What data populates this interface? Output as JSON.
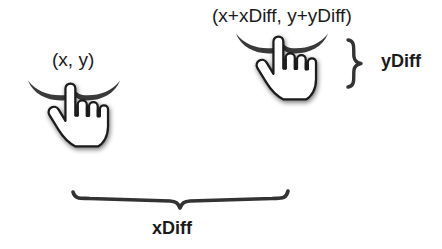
{
  "diagram": {
    "background_color": "#ffffff",
    "ink_color": "#333333",
    "text_color": "#1b1b1b",
    "hand_fill_color": "#ffffff",
    "hand_outline_color": "#1a1a1a",
    "shadow_color": "#9a9a9a",
    "labels": {
      "start_point": "(x, y)",
      "end_point": "(x+xDiff, y+yDiff)",
      "y_delta": "yDiff",
      "x_delta": "xDiff"
    },
    "icons": {
      "start_hand": "pointing-hand-cursor-icon",
      "end_hand": "pointing-hand-cursor-icon",
      "start_tap": "tap-arc-icon",
      "end_tap": "tap-arc-icon",
      "vertical_brace": "curly-brace-vertical-icon",
      "horizontal_brace": "curly-brace-horizontal-icon"
    }
  }
}
